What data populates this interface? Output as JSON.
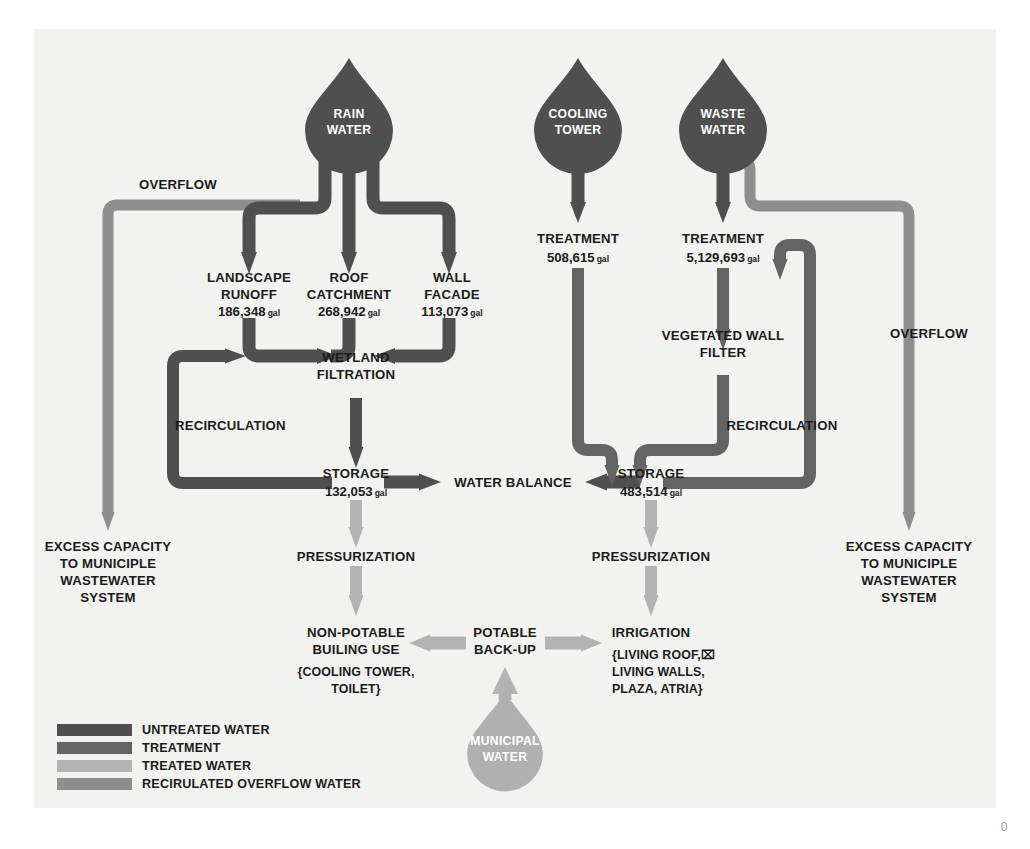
{
  "page": {
    "page_number": "0",
    "background": "#f2f2f0"
  },
  "colors": {
    "untreated_water": "#4f4f4f",
    "treatment": "#646464",
    "treated_water": "#b3b3b3",
    "recirculated_overflow_water": "#8e8e8e",
    "municipal_drop": "#b0b0b0",
    "text": "#1b1b1b"
  },
  "sources": [
    {
      "id": "rain-water",
      "line1": "RAIN",
      "line2": "WATER"
    },
    {
      "id": "cooling-tower",
      "line1": "COOLING",
      "line2": "TOWER"
    },
    {
      "id": "waste-water",
      "line1": "WASTE",
      "line2": "WATER"
    },
    {
      "id": "municipal-water",
      "line1": "MUNICIPAL",
      "line2": "WATER"
    }
  ],
  "nodes": {
    "landscape_runoff": {
      "line1": "LANDSCAPE",
      "line2": "RUNOFF",
      "value": "186,348",
      "unit": "gal"
    },
    "roof_catchment": {
      "line1": "ROOF",
      "line2": "CATCHMENT",
      "value": "268,942",
      "unit": "gal"
    },
    "wall_facade": {
      "line1": "WALL",
      "line2": "FACADE",
      "value": "113,073",
      "unit": "gal"
    },
    "wetland_filtration": {
      "line1": "WETLAND",
      "line2": "FILTRATION"
    },
    "storage_left": {
      "line1": "STORAGE",
      "value": "132,053",
      "unit": "gal"
    },
    "storage_right": {
      "line1": "STORAGE",
      "value": "483,514",
      "unit": "gal"
    },
    "treatment_cooling": {
      "line1": "TREATMENT",
      "value": "508,615",
      "unit": "gal"
    },
    "treatment_waste": {
      "line1": "TREATMENT",
      "value": "5,129,693",
      "unit": "gal"
    },
    "vegetated_wall_filter": {
      "line1": "VEGETATED WALL",
      "line2": "FILTER"
    },
    "water_balance": {
      "line1": "WATER BALANCE"
    },
    "pressurization_left": {
      "line1": "PRESSURIZATION"
    },
    "pressurization_right": {
      "line1": "PRESSURIZATION"
    },
    "non_potable_building_use": {
      "line1": "NON-POTABLE",
      "line2": "BUILING USE",
      "line3": "{COOLING TOWER,",
      "line4": "TOILET}"
    },
    "potable_backup": {
      "line1": "POTABLE",
      "line2": "BACK-UP"
    },
    "irrigation": {
      "line1": "IRRIGATION",
      "line2": "{LIVING ROOF,⌧",
      "line3": "LIVING WALLS,",
      "line4": "PLAZA, ATRIA}"
    },
    "overflow_left": {
      "line1": "OVERFLOW"
    },
    "overflow_right": {
      "line1": "OVERFLOW"
    },
    "recirculation_left": {
      "line1": "RECIRCULATION"
    },
    "recirculation_right": {
      "line1": "RECIRCULATION"
    },
    "excess_left": {
      "line1": "EXCESS CAPACITY",
      "line2": "TO MUNICIPLE",
      "line3": "WASTEWATER",
      "line4": "SYSTEM"
    },
    "excess_right": {
      "line1": "EXCESS CAPACITY",
      "line2": "TO MUNICIPLE",
      "line3": "WASTEWATER",
      "line4": "SYSTEM"
    }
  },
  "legend": {
    "items": [
      {
        "label": "UNTREATED WATER",
        "color": "#4f4f4f"
      },
      {
        "label": "TREATMENT",
        "color": "#646464"
      },
      {
        "label": "TREATED WATER",
        "color": "#b3b3b3"
      },
      {
        "label": "RECIRULATED OVERFLOW WATER",
        "color": "#8e8e8e"
      }
    ]
  }
}
